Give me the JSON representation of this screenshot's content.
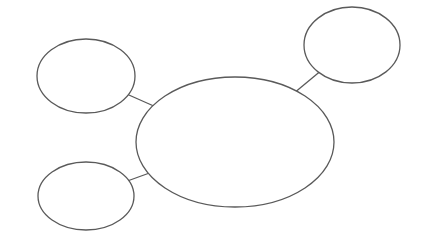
{
  "diagram": {
    "type": "concept-map",
    "canvas": {
      "width": 422,
      "height": 239,
      "background": "#ffffff"
    },
    "style": {
      "stroke_color": "#5a5a5a",
      "stroke_width": 1.3,
      "node_fill": "#ffffff"
    },
    "nodes": [
      {
        "id": "central-topic",
        "shape": "ellipse",
        "cx": 235,
        "cy": 142,
        "rx": 99,
        "ry": 65
      },
      {
        "id": "subtopic-top-left",
        "shape": "ellipse",
        "cx": 86,
        "cy": 76,
        "rx": 49,
        "ry": 37
      },
      {
        "id": "subtopic-bottom-left",
        "shape": "ellipse",
        "cx": 86,
        "cy": 196,
        "rx": 48,
        "ry": 34
      },
      {
        "id": "subtopic-top-right",
        "shape": "ellipse",
        "cx": 352,
        "cy": 45,
        "rx": 48,
        "ry": 38
      }
    ],
    "edges": [
      {
        "from": "central-topic",
        "to": "subtopic-top-left"
      },
      {
        "from": "central-topic",
        "to": "subtopic-bottom-left"
      },
      {
        "from": "central-topic",
        "to": "subtopic-top-right"
      }
    ]
  }
}
